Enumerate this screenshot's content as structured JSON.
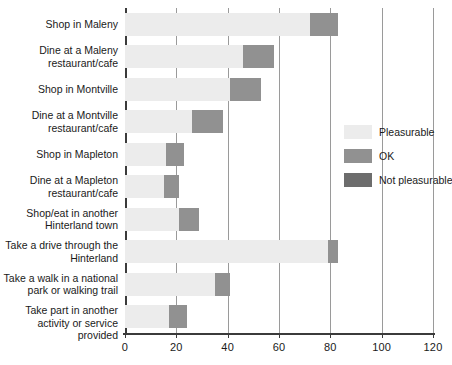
{
  "chart_data": {
    "type": "bar",
    "orientation": "horizontal",
    "stacked": true,
    "title": "",
    "xlabel": "",
    "ylabel": "",
    "xlim": [
      0,
      120
    ],
    "xticks": [
      0,
      20,
      40,
      60,
      80,
      100,
      120
    ],
    "xtick_labels": [
      "0",
      "20",
      "40",
      "60",
      "80",
      "100",
      "120"
    ],
    "grid": "vertical",
    "legend_position": "right",
    "categories": [
      "Shop in Maleny",
      "Dine at a Maleny\nrestaurant/cafe",
      "Shop in Montville",
      "Dine at a Montville\nrestaurant/cafe",
      "Shop in Mapleton",
      "Dine at a Mapleton\nrestaurant/cafe",
      "Shop/eat in another\nHinterland town",
      "Take a drive through the\nHinterland",
      "Take a walk in a national\npark or walking trail",
      "Take part in another\nactivity or service provided"
    ],
    "series": [
      {
        "name": "Pleasurable",
        "color": "#ececec",
        "values": [
          72,
          46,
          41,
          26,
          16,
          15,
          21,
          79,
          35,
          17
        ]
      },
      {
        "name": "OK",
        "color": "#919191",
        "values": [
          11,
          12,
          12,
          12,
          7,
          6,
          8,
          4,
          6,
          7
        ]
      },
      {
        "name": "Not pleasurable",
        "color": "#6d6d6d",
        "values": [
          0,
          0,
          0,
          0,
          0,
          0,
          0,
          0,
          0,
          0
        ]
      }
    ]
  },
  "legend": {
    "items": [
      {
        "label": "Pleasurable",
        "swatch": "pleasurable"
      },
      {
        "label": "OK",
        "swatch": "ok"
      },
      {
        "label": "Not pleasurable",
        "swatch": "notpleas"
      }
    ]
  }
}
